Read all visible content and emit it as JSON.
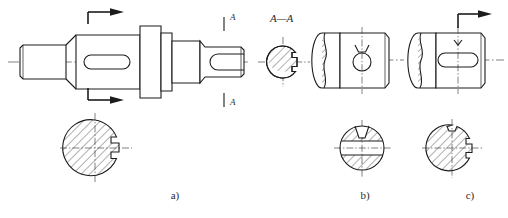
{
  "sheet": {
    "width": 508,
    "height": 218,
    "background": "#ffffff",
    "line_color": "#1c1c1c",
    "centerline_color": "#4a4a4a",
    "title": "Engineering shaft drawing with keyway sections"
  },
  "captions": {
    "a": "a)",
    "b": "b)",
    "c": "c)"
  },
  "section_labels": {
    "aa_title": "A—A",
    "mark_top": "A",
    "mark_bottom": "A"
  },
  "views": {
    "a": {
      "name": "stepped-shaft-front-view",
      "description": "Stepped shaft front view with closed keyway slot and A-A cutting plane",
      "section_circle_label": "a)"
    },
    "aa_section": {
      "name": "section-a-a",
      "description": "Hatched circular cross section with keyway notch at right"
    },
    "b": {
      "name": "shaft-end-with-cross-hole",
      "description": "Shaft end view with partial break-out section at left and through hole"
    },
    "c": {
      "name": "shaft-end-with-keyway",
      "description": "Shaft end view with break-out section at left and open keyway with cutting plane arrow"
    },
    "a_section_circle": {
      "name": "section-circle-a",
      "description": "Hatched circular section with keyway notch at right"
    },
    "b_section_circle": {
      "name": "section-circle-b",
      "description": "Hatched circular section with horizontal through hole and countersink at top"
    },
    "c_section_circle": {
      "name": "section-circle-c",
      "description": "Hatched circular section with keyway notch at top and notch at right"
    }
  }
}
